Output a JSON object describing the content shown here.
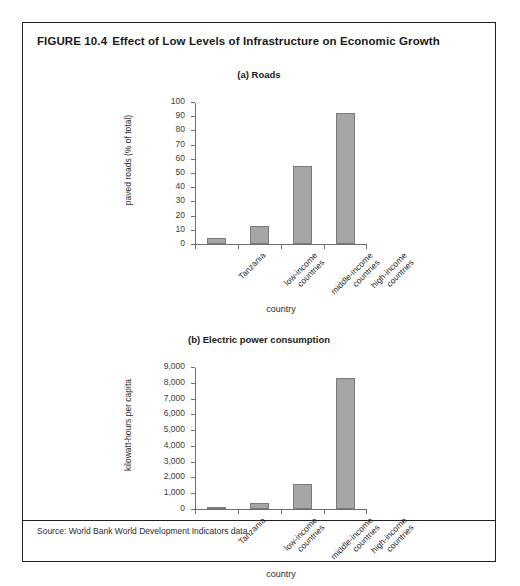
{
  "figure": {
    "number": "FIGURE 10.4",
    "title": "Effect of Low Levels of Infrastructure on Economic Growth",
    "source": "Source: World Bank World Development Indicators data."
  },
  "chart_data": [
    {
      "type": "bar",
      "panel": "a",
      "title": "(a) Roads",
      "categories": [
        "Tanzania",
        "low-income countries",
        "middle-income countries",
        "high-income countries"
      ],
      "category_lines": [
        [
          "Tanzania"
        ],
        [
          "low-income",
          "countries"
        ],
        [
          "middle-income",
          "countries"
        ],
        [
          "high-income",
          "countries"
        ]
      ],
      "values": [
        4,
        13,
        55,
        92
      ],
      "xlabel": "country",
      "ylabel": "paved roads (% of total)",
      "ylim": [
        0,
        100
      ],
      "yticks": [
        0,
        10,
        20,
        30,
        40,
        50,
        60,
        70,
        80,
        90,
        100
      ],
      "ytick_labels": [
        "0",
        "10",
        "20",
        "30",
        "40",
        "50",
        "60",
        "70",
        "80",
        "90",
        "100"
      ],
      "grid": false,
      "legend": "none"
    },
    {
      "type": "bar",
      "panel": "b",
      "title": "(b) Electric power consumption",
      "categories": [
        "Tanzania",
        "low-income countries",
        "middle-income countries",
        "high-income countries"
      ],
      "category_lines": [
        [
          "Tanzania"
        ],
        [
          "low-income",
          "countries"
        ],
        [
          "middle-income",
          "countries"
        ],
        [
          "high-income",
          "countries"
        ]
      ],
      "values": [
        60,
        350,
        1600,
        8300
      ],
      "xlabel": "country",
      "ylabel": "kilowatt-hours per capita",
      "ylim": [
        0,
        9000
      ],
      "yticks": [
        0,
        1000,
        2000,
        3000,
        4000,
        5000,
        6000,
        7000,
        8000,
        9000
      ],
      "ytick_labels": [
        "0",
        "1,000",
        "2,000",
        "3,000",
        "4,000",
        "5,000",
        "6,000",
        "7,000",
        "8,000",
        "9,000"
      ],
      "grid": false,
      "legend": "none"
    }
  ],
  "colors": {
    "bar_fill": "#a6a6a6",
    "bar_stroke": "#7a7a7a",
    "axis": "#6d6e71",
    "frame": "#231f20",
    "text": "#1a1a1a"
  }
}
